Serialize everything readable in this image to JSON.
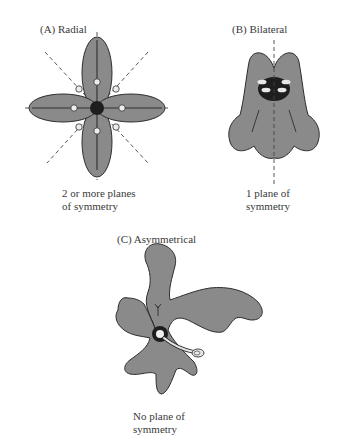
{
  "panels": [
    {
      "id": "A",
      "title": "(A)  Radial",
      "caption_line1": "2 or more planes",
      "caption_line2": "of symmetry"
    },
    {
      "id": "B",
      "title": "(B)  Bilateral",
      "caption_line1": "1 plane of",
      "caption_line2": "symmetry"
    },
    {
      "id": "C",
      "title": "(C)  Asymmetrical",
      "caption_line1": "No plane of",
      "caption_line2": "symmetry"
    }
  ],
  "colors": {
    "petal_fill": "#8a8a8a",
    "outline": "#2e2e2e",
    "center": "#1e1e1e",
    "background": "#ffffff"
  }
}
